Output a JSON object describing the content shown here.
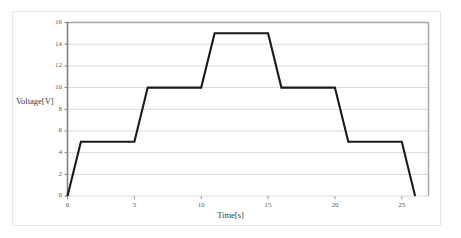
{
  "chart_data": {
    "type": "line",
    "title": "",
    "xlabel": "Time[s]",
    "ylabel": "Voltage[V]",
    "xlim": [
      0,
      27
    ],
    "ylim": [
      0,
      16
    ],
    "xticks": [
      0,
      5,
      10,
      15,
      20,
      25
    ],
    "yticks": [
      0,
      2,
      4,
      6,
      8,
      10,
      12,
      14,
      16
    ],
    "grid": "horizontal",
    "legend_position": "none",
    "line_color": "#1a1a1a",
    "grid_color": "#d9d9d9",
    "series": [
      {
        "name": "Voltage",
        "x": [
          0,
          1,
          5,
          6,
          10,
          11,
          15,
          16,
          20,
          21,
          25,
          26
        ],
        "y": [
          0,
          5,
          5,
          10,
          10,
          15,
          15,
          10,
          10,
          5,
          5,
          0
        ]
      }
    ]
  },
  "axes": {
    "y_title": "Voltage[V]",
    "x_title": "Time[s]",
    "y_tick_labels": [
      "16",
      "14",
      "12",
      "10",
      "8",
      "6",
      "4",
      "2",
      "0"
    ],
    "x_tick_labels": [
      "0",
      "5",
      "10",
      "15",
      "20",
      "25"
    ]
  }
}
